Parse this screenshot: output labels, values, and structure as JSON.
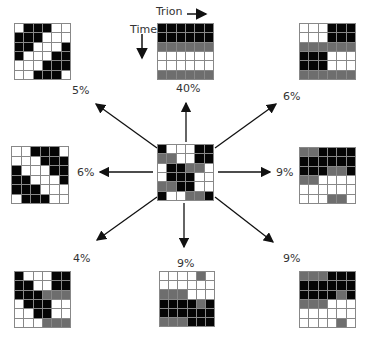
{
  "axis_labels": {
    "trion": "Trion",
    "time": "Time"
  },
  "center": {
    "name": "center-pattern",
    "cells": [
      "BWWWBB",
      "GGWWBB",
      "WBBGGW",
      "WBBBWW",
      "GGBBWW",
      "BWWGGB"
    ]
  },
  "patterns": [
    {
      "id": "top-left",
      "percent": "5%",
      "cells": [
        "WBBBWW",
        "BBBWWW",
        "BBWWWB",
        "BWWWBB",
        "WWWBBB",
        "WWBBBW"
      ]
    },
    {
      "id": "top-center",
      "percent": "40%",
      "cells": [
        "BBBBBB",
        "BBBBBB",
        "GGGGGG",
        "WWWWWW",
        "WWWWWW",
        "GGGGGG"
      ]
    },
    {
      "id": "top-right",
      "percent": "6%",
      "cells": [
        "WWWBBB",
        "WWWBBB",
        "GGGGGG",
        "BBBWWW",
        "BBBWWW",
        "GGGGGG"
      ]
    },
    {
      "id": "middle-left",
      "percent": "6%",
      "cells": [
        "WWBBBW",
        "WWWBBB",
        "BWWWBB",
        "BBWWWB",
        "BBBWWW",
        "WBBBWW"
      ]
    },
    {
      "id": "middle-right",
      "percent": "9%",
      "cells": [
        "GGBBBB",
        "BBBBBB",
        "BBBGGB",
        "GGWWWW",
        "WWWWWW",
        "WWWGGW"
      ]
    },
    {
      "id": "bottom-left",
      "percent": "4%",
      "cells": [
        "BWWWBB",
        "BBWWBB",
        "BBBGGG",
        "WBBBWW",
        "WWBBWW",
        "WWWGGG"
      ]
    },
    {
      "id": "bottom-center",
      "percent": "9%",
      "cells": [
        "WWWWGW",
        "WWWWWW",
        "GGGWWW",
        "BBBBGB",
        "BBBBBB",
        "GGGBBB"
      ]
    },
    {
      "id": "bottom-right",
      "percent": "9%",
      "cells": [
        "GGGBBB",
        "BBBBBB",
        "BBBBGB",
        "GGGWWW",
        "WWWWWW",
        "WWWWGW"
      ]
    }
  ],
  "legend": {
    "B": "black (active)",
    "G": "gray",
    "W": "white (inactive)"
  },
  "colors": {
    "black": "#050505",
    "gray": "#6e6e6e",
    "white": "#ffffff",
    "border": "#888888"
  }
}
